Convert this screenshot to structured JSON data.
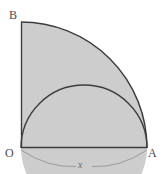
{
  "figure": {
    "background_color": "#ffffff",
    "shaded_region_color": "#cdcdcd",
    "stroke_color": "#3d3d3d",
    "thin_stroke_color": "#8a8a8a",
    "label_color": "#4a4a4a",
    "dimension_label_color": "#6b6b6b",
    "vertices": {
      "origin": {
        "label": "O",
        "x": 21,
        "y": 148
      },
      "right": {
        "label": "A",
        "x": 147,
        "y": 148
      },
      "top": {
        "label": "B",
        "x": 21,
        "y": 22
      }
    },
    "dimension": {
      "label": "x",
      "measures": "OA",
      "position": "below-baseline"
    },
    "geometry": {
      "quarter_circle": {
        "center": "O",
        "radius": 126,
        "from": "B",
        "to": "A"
      },
      "semicircle": {
        "diameter": "OA",
        "center_x": 84,
        "center_y": 148,
        "radius": 63
      },
      "segments": [
        {
          "name": "OB",
          "from": "O",
          "to": "B"
        },
        {
          "name": "OA",
          "from": "O",
          "to": "A"
        }
      ]
    }
  }
}
